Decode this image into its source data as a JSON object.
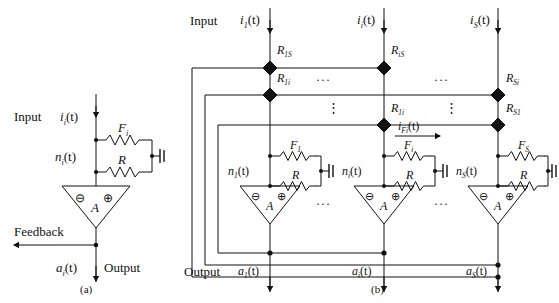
{
  "figure": {
    "panels": [
      {
        "id": "a",
        "caption": "(a)",
        "labels": {
          "input": "Input",
          "output": "Output",
          "feedback": "Feedback",
          "input_current": "i",
          "input_current_sub": "i",
          "input_current_tail": "(t)",
          "node": "n",
          "node_sub": "i",
          "node_tail": "(t)",
          "out_signal": "a",
          "out_signal_sub": "i",
          "out_signal_tail": "(t)",
          "resistor_f": "F",
          "resistor_f_sub": "i",
          "resistor_r": "R",
          "amp": "A",
          "minus": "⊖",
          "plus": "⊕"
        }
      },
      {
        "id": "b",
        "caption": "(b)",
        "labels": {
          "input": "Input",
          "output": "Output",
          "amp": "A",
          "minus": "⊖",
          "plus": "⊕",
          "resistor_r": "R",
          "feedback_current": "i",
          "feedback_current_sub": "Fi",
          "feedback_current_tail": "(t)",
          "hdots": "···",
          "vdots": "⋮"
        },
        "columns": [
          {
            "input_current": "i",
            "input_current_sub": "1",
            "input_current_tail": "(t)",
            "node": "n",
            "node_sub": "1",
            "node_tail": "(t)",
            "out_signal": "a",
            "out_signal_sub": "1",
            "out_signal_tail": "(t)",
            "resistor_f": "F",
            "resistor_f_sub": "1"
          },
          {
            "input_current": "i",
            "input_current_sub": "i",
            "input_current_tail": "(t)",
            "node": "n",
            "node_sub": "i",
            "node_tail": "(t)",
            "out_signal": "a",
            "out_signal_sub": "i",
            "out_signal_tail": "(t)",
            "resistor_f": "F",
            "resistor_f_sub": "i"
          },
          {
            "input_current": "i",
            "input_current_sub": "S",
            "input_current_tail": "(t)",
            "node": "n",
            "node_sub": "S",
            "node_tail": "(t)",
            "out_signal": "a",
            "out_signal_sub": "S",
            "out_signal_tail": "(t)",
            "resistor_f": "F",
            "resistor_f_sub": "S"
          }
        ],
        "coupling_resistors": [
          {
            "name": "R",
            "sub": "1S"
          },
          {
            "name": "R",
            "sub": "1i"
          },
          {
            "name": "R",
            "sub": "iS"
          },
          {
            "name": "R",
            "sub": "1i"
          },
          {
            "name": "R",
            "sub": "Si"
          },
          {
            "name": "R",
            "sub": "S1"
          }
        ]
      }
    ]
  }
}
